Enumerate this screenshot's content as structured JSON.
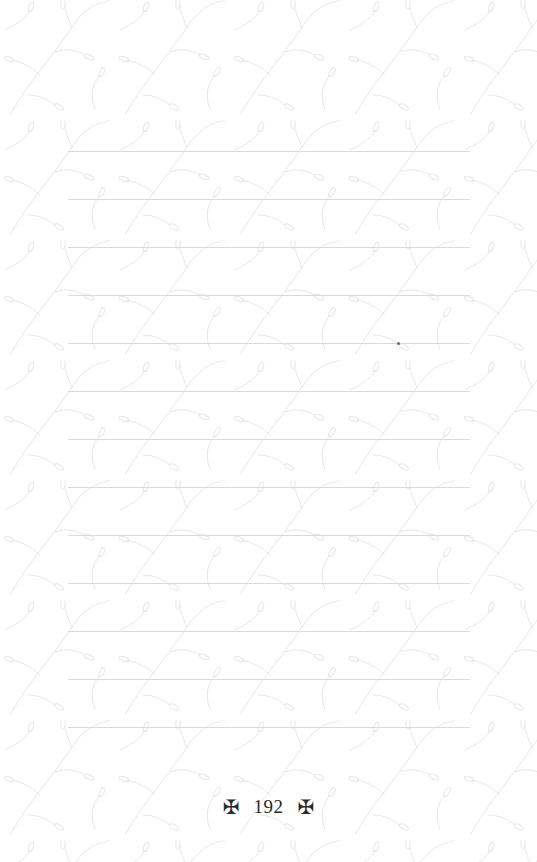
{
  "page": {
    "background_color": "#ffffff",
    "pattern": "leaf-branches",
    "pattern_color": "#e8e8e8",
    "line_color": "#dadada",
    "ruled_lines": {
      "count": 13,
      "first_y": 151,
      "spacing": 48,
      "left": 68,
      "right": 470
    }
  },
  "footer": {
    "left_ornament": "✠",
    "page_number": "192",
    "right_ornament": "✠",
    "ornament_icon": "maltese-cross-icon"
  }
}
